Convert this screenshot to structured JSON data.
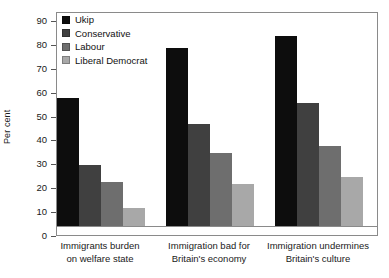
{
  "chart_data": {
    "type": "bar",
    "title": "",
    "subtitle": "",
    "xlabel": "",
    "ylabel": "Per cent",
    "ylim": [
      0,
      90
    ],
    "yticks": [
      0,
      10,
      20,
      30,
      40,
      50,
      60,
      70,
      80,
      90
    ],
    "grid": false,
    "legend_position": "top-left inside plot",
    "categories": [
      "Immigrants burden on welfare state",
      "Immigration bad for Britain's economy",
      "Immigration undermines Britain's culture"
    ],
    "category_lines": [
      [
        "Immigrants burden",
        "on welfare state"
      ],
      [
        "Immigration bad for",
        "Britain's economy"
      ],
      [
        "Immigration undermines",
        "Britain's culture"
      ]
    ],
    "series": [
      {
        "name": "Ukip",
        "color": "#0d0d0d",
        "values": [
          54,
          75,
          80
        ]
      },
      {
        "name": "Conservative",
        "color": "#404040",
        "values": [
          26,
          43,
          52
        ]
      },
      {
        "name": "Labour",
        "color": "#6e6e6e",
        "values": [
          19,
          31,
          34
        ]
      },
      {
        "name": "Liberal Democrat",
        "color": "#a8a8a8",
        "values": [
          8,
          18,
          21
        ]
      }
    ]
  },
  "axis": {
    "y_title": "Per cent",
    "y_tick_labels": [
      "90",
      "80",
      "70",
      "60",
      "50",
      "40",
      "30",
      "20",
      "10",
      "0"
    ]
  },
  "legend": {
    "items": [
      {
        "label": "Ukip",
        "color": "#0d0d0d"
      },
      {
        "label": "Conservative",
        "color": "#404040"
      },
      {
        "label": "Labour",
        "color": "#6e6e6e"
      },
      {
        "label": "Liberal Democrat",
        "color": "#a8a8a8"
      }
    ]
  }
}
